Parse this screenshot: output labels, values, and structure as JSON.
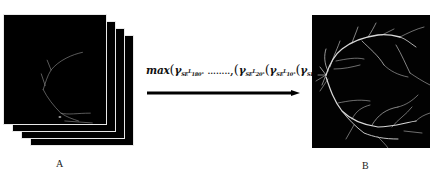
{
  "figure": {
    "left_panel": {
      "label": "A",
      "description": "stack of binary retinal vessel images",
      "sheet_count": 4
    },
    "right_panel": {
      "label": "B",
      "description": "maximum-response retinal vessel map"
    },
    "operation": {
      "operator": "max",
      "formula_parts": {
        "op": "max",
        "gamma": "γ",
        "se": "SE",
        "angle_first": "180°",
        "ellipsis": "........",
        "angle_k": "20°",
        "angle_2": "10°",
        "angle_0": "0°",
        "superscript": "L",
        "input": "I",
        "input_sub": "rs"
      },
      "formula_text": "max(γ_SE_180° ........,(γ_SE_20°(γ_SE_10°(γ_SE_0°(I_rs))))",
      "arrow": "right-arrow"
    },
    "colors": {
      "background": "#ffffff",
      "image_bg": "#000000",
      "vessel": "#d9d9d9",
      "arrow": "#000000"
    }
  }
}
